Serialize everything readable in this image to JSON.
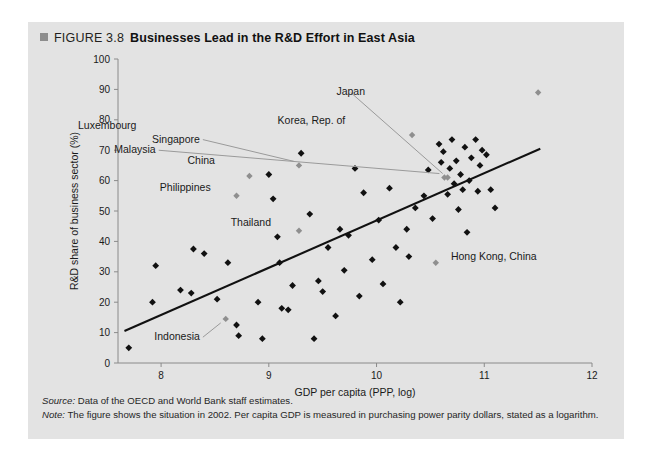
{
  "figure": {
    "bullet_icon": "square-bullet-icon",
    "number": "FIGURE 3.8",
    "title": "Businesses Lead in the R&D Effort in East Asia"
  },
  "notes": {
    "source_label": "Source:",
    "source_text": " Data of the OECD and World Bank staff estimates.",
    "note_label": "Note:",
    "note_text": " The figure shows the situation in 2002. Per capita GDP is measured in purchasing power parity dollars, stated as a logarithm."
  },
  "colors": {
    "panel_background": "#e3e3e3",
    "marker": "#111111",
    "highlight_marker": "#8f8f8f",
    "trend_line": "#111111",
    "axis": "#8a8a8a",
    "text": "#231f20"
  },
  "chart_data": {
    "type": "scatter",
    "title": "Businesses Lead in the R&D Effort in East Asia",
    "xlabel": "GDP per capita (PPP, log)",
    "ylabel": "R&D share of business sector (%)",
    "xlim": [
      7.6,
      12
    ],
    "ylim": [
      0,
      100
    ],
    "xticks": [
      8,
      9,
      10,
      11,
      12
    ],
    "yticks": [
      0,
      10,
      20,
      30,
      40,
      50,
      60,
      70,
      80,
      90,
      100
    ],
    "grid": false,
    "legend": "none",
    "trend_line": {
      "label": "fitted trend",
      "x": [
        7.66,
        11.52
      ],
      "y": [
        10.5,
        70.5
      ]
    },
    "labeled_points": [
      {
        "name": "Luxembourg",
        "x": 11.5,
        "y": 89.0,
        "label_dx": -4,
        "label_dy": -12,
        "anchor": "middle",
        "leader": false
      },
      {
        "name": "Japan",
        "x": 10.66,
        "y": 61.0,
        "label_dx": -0.9,
        "label_dy": 27.0,
        "anchor": "middle",
        "leader": true
      },
      {
        "name": "Korea, Rep. of",
        "x": 10.33,
        "y": 75.0,
        "label_dx": -0.62,
        "label_dy": 3.5,
        "anchor": "end",
        "leader": false
      },
      {
        "name": "Singapore",
        "x": 9.28,
        "y": 65.0,
        "label_dx": -0.92,
        "label_dy": 7.5,
        "anchor": "end",
        "leader": true
      },
      {
        "name": "Malaysia",
        "x": 10.63,
        "y": 61.0,
        "label_dx": -2.68,
        "label_dy": 8.0,
        "anchor": "end",
        "leader": true
      },
      {
        "name": "China",
        "x": 8.82,
        "y": 61.5,
        "label_dx": -0.32,
        "label_dy": 4.0,
        "anchor": "end",
        "leader": false
      },
      {
        "name": "Philippines",
        "x": 8.7,
        "y": 55.0,
        "label_dx": -0.24,
        "label_dy": 1.5,
        "anchor": "end",
        "leader": false
      },
      {
        "name": "Thailand",
        "x": 9.28,
        "y": 43.5,
        "label_dx": -0.26,
        "label_dy": 1.5,
        "anchor": "end",
        "leader": false
      },
      {
        "name": "Indonesia",
        "x": 8.6,
        "y": 14.5,
        "label_dx": -0.24,
        "label_dy": -7.0,
        "anchor": "end",
        "leader": true
      },
      {
        "name": "Hong Kong, China",
        "x": 10.55,
        "y": 33.0,
        "label_dx": 0.14,
        "label_dy": 0.8,
        "anchor": "start",
        "leader": false
      }
    ],
    "points": [
      {
        "x": 7.7,
        "y": 5.0
      },
      {
        "x": 7.92,
        "y": 20.0
      },
      {
        "x": 7.95,
        "y": 32.0
      },
      {
        "x": 8.18,
        "y": 24.0
      },
      {
        "x": 8.28,
        "y": 23.0
      },
      {
        "x": 8.3,
        "y": 37.5
      },
      {
        "x": 8.4,
        "y": 36.0
      },
      {
        "x": 8.52,
        "y": 21.0
      },
      {
        "x": 8.62,
        "y": 33.0
      },
      {
        "x": 8.7,
        "y": 12.5
      },
      {
        "x": 8.72,
        "y": 9.0
      },
      {
        "x": 8.9,
        "y": 20.0
      },
      {
        "x": 8.94,
        "y": 8.0
      },
      {
        "x": 9.0,
        "y": 62.0
      },
      {
        "x": 9.04,
        "y": 54.0
      },
      {
        "x": 9.08,
        "y": 41.5
      },
      {
        "x": 9.1,
        "y": 33.0
      },
      {
        "x": 9.12,
        "y": 18.0
      },
      {
        "x": 9.18,
        "y": 17.5
      },
      {
        "x": 9.22,
        "y": 25.5
      },
      {
        "x": 9.3,
        "y": 69.0
      },
      {
        "x": 9.38,
        "y": 49.0
      },
      {
        "x": 9.42,
        "y": 8.0
      },
      {
        "x": 9.46,
        "y": 27.0
      },
      {
        "x": 9.5,
        "y": 23.5
      },
      {
        "x": 9.55,
        "y": 38.0
      },
      {
        "x": 9.62,
        "y": 15.5
      },
      {
        "x": 9.66,
        "y": 44.0
      },
      {
        "x": 9.7,
        "y": 30.5
      },
      {
        "x": 9.74,
        "y": 42.0
      },
      {
        "x": 9.8,
        "y": 64.0
      },
      {
        "x": 9.84,
        "y": 22.0
      },
      {
        "x": 9.88,
        "y": 56.0
      },
      {
        "x": 9.96,
        "y": 34.0
      },
      {
        "x": 10.02,
        "y": 47.0
      },
      {
        "x": 10.06,
        "y": 26.0
      },
      {
        "x": 10.12,
        "y": 57.5
      },
      {
        "x": 10.18,
        "y": 38.0
      },
      {
        "x": 10.22,
        "y": 20.0
      },
      {
        "x": 10.28,
        "y": 44.0
      },
      {
        "x": 10.3,
        "y": 35.0
      },
      {
        "x": 10.36,
        "y": 51.0
      },
      {
        "x": 10.44,
        "y": 55.0
      },
      {
        "x": 10.48,
        "y": 63.5
      },
      {
        "x": 10.52,
        "y": 47.5
      },
      {
        "x": 10.58,
        "y": 72.0
      },
      {
        "x": 10.6,
        "y": 66.0
      },
      {
        "x": 10.62,
        "y": 69.5
      },
      {
        "x": 10.66,
        "y": 55.5
      },
      {
        "x": 10.68,
        "y": 64.0
      },
      {
        "x": 10.7,
        "y": 73.5
      },
      {
        "x": 10.72,
        "y": 59.0
      },
      {
        "x": 10.74,
        "y": 66.5
      },
      {
        "x": 10.76,
        "y": 50.5
      },
      {
        "x": 10.78,
        "y": 62.0
      },
      {
        "x": 10.8,
        "y": 57.0
      },
      {
        "x": 10.82,
        "y": 71.0
      },
      {
        "x": 10.84,
        "y": 43.0
      },
      {
        "x": 10.86,
        "y": 60.0
      },
      {
        "x": 10.88,
        "y": 67.5
      },
      {
        "x": 10.92,
        "y": 73.5
      },
      {
        "x": 10.94,
        "y": 56.5
      },
      {
        "x": 10.96,
        "y": 65.0
      },
      {
        "x": 10.98,
        "y": 70.0
      },
      {
        "x": 11.02,
        "y": 68.5
      },
      {
        "x": 11.06,
        "y": 57.0
      },
      {
        "x": 11.1,
        "y": 51.0
      }
    ]
  }
}
